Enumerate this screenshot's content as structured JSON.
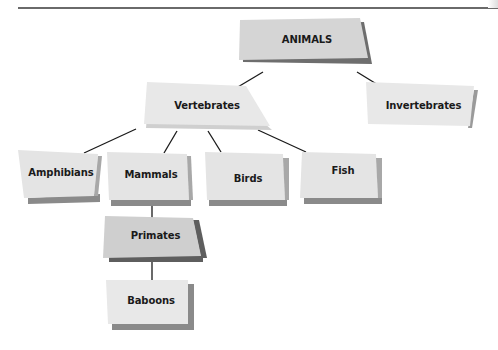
{
  "diagram": {
    "type": "hierarchy-tree",
    "root": "ANIMALS",
    "nodes": [
      {
        "id": "animals",
        "label": "ANIMALS",
        "parent": null
      },
      {
        "id": "vertebrates",
        "label": "Vertebrates",
        "parent": "animals"
      },
      {
        "id": "invertebrates",
        "label": "Invertebrates",
        "parent": "animals"
      },
      {
        "id": "amphibians",
        "label": "Amphibians",
        "parent": "vertebrates"
      },
      {
        "id": "mammals",
        "label": "Mammals",
        "parent": "vertebrates"
      },
      {
        "id": "birds",
        "label": "Birds",
        "parent": "vertebrates"
      },
      {
        "id": "fish",
        "label": "Fish",
        "parent": "vertebrates"
      },
      {
        "id": "primates",
        "label": "Primates",
        "parent": "mammals"
      },
      {
        "id": "baboons",
        "label": "Baboons",
        "parent": "primates"
      }
    ]
  },
  "labels": {
    "animals": "ANIMALS",
    "vertebrates": "Vertebrates",
    "invertebrates": "Invertebrates",
    "amphibians": "Amphibians",
    "mammals": "Mammals",
    "birds": "Birds",
    "fish": "Fish",
    "primates": "Primates",
    "baboons": "Baboons"
  },
  "colors": {
    "box_fill": "#e6e6e6",
    "highlight_fill": "#cfcfcf",
    "shadow": "#6e6e6e",
    "line": "#1a1a1a"
  }
}
